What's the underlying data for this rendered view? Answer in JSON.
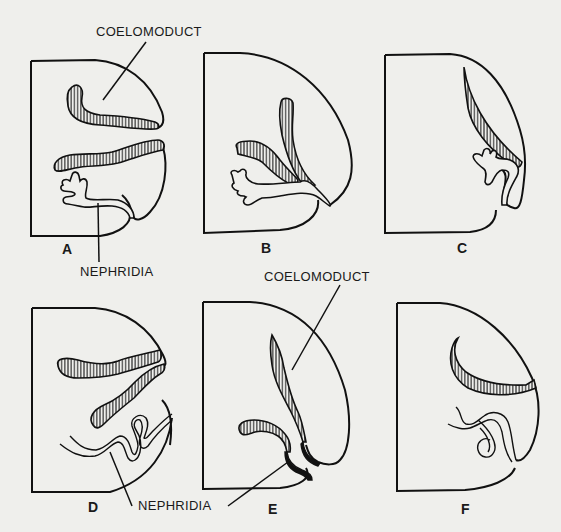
{
  "figure": {
    "labels": {
      "coelomoduct_top": "COELOMODUCT",
      "nephridia_top": "NEPHRIDIA",
      "coelomoduct_bottom": "COELOMODUCT",
      "nephridia_bottom": "NEPHRIDIA"
    },
    "panels": [
      {
        "id": "A",
        "letter": "A"
      },
      {
        "id": "B",
        "letter": "B"
      },
      {
        "id": "C",
        "letter": "C"
      },
      {
        "id": "D",
        "letter": "D"
      },
      {
        "id": "E",
        "letter": "E"
      },
      {
        "id": "F",
        "letter": "F"
      }
    ],
    "colors": {
      "background": "#efefec",
      "ink": "#111111"
    }
  }
}
